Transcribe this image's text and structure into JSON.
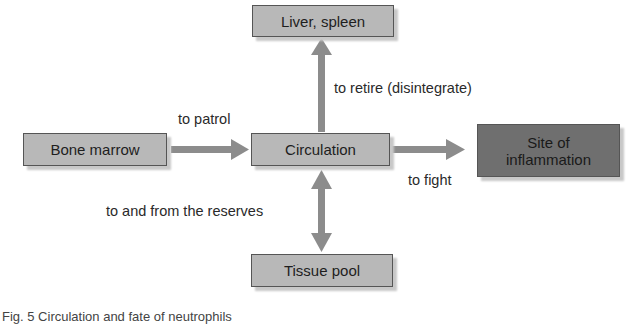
{
  "diagram": {
    "nodes": {
      "liver_spleen": "Liver, spleen",
      "bone_marrow": "Bone marrow",
      "circulation": "Circulation",
      "site_of_inflammation": "Site of inflammation",
      "tissue_pool": "Tissue pool"
    },
    "edges": {
      "to_patrol": "to patrol",
      "to_retire": "to retire (disintegrate)",
      "to_fight": "to fight",
      "to_and_from": "to and from the reserves"
    },
    "colors": {
      "box_light": "#b8b8b8",
      "box_dark": "#6f6f6f",
      "arrow": "#8c8c8c"
    }
  },
  "caption": "Fig. 5 Circulation and fate of neutrophils"
}
